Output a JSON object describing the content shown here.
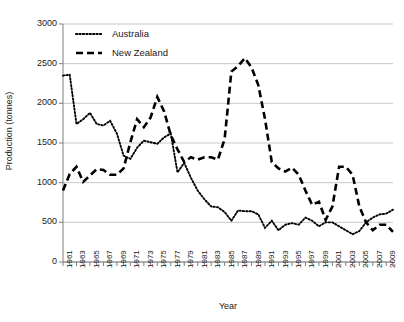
{
  "chart_data": {
    "type": "line",
    "title": "",
    "xlabel": "Year",
    "ylabel": "Production (tonnes)",
    "xlim": [
      1961,
      2010
    ],
    "ylim": [
      0,
      3000
    ],
    "yticks": [
      0,
      500,
      1000,
      1500,
      2000,
      2500,
      3000
    ],
    "ytick_labels": [
      "0",
      "500",
      "1000",
      "1500",
      "2000",
      "2500",
      "3000"
    ],
    "xticks": [
      1961,
      1962,
      1963,
      1964,
      1965,
      1966,
      1967,
      1968,
      1969,
      1970,
      1971,
      1972,
      1973,
      1974,
      1975,
      1976,
      1977,
      1978,
      1979,
      1980,
      1981,
      1982,
      1983,
      1984,
      1985,
      1986,
      1987,
      1988,
      1989,
      1990,
      1991,
      1992,
      1993,
      1994,
      1995,
      1996,
      1997,
      1998,
      1999,
      2000,
      2001,
      2002,
      2003,
      2004,
      2005,
      2006,
      2007,
      2008,
      2009,
      2010
    ],
    "xtick_labels": [
      "1961",
      "",
      "1963",
      "",
      "1965",
      "",
      "1967",
      "",
      "1969",
      "",
      "1971",
      "",
      "1973",
      "",
      "1975",
      "",
      "1977",
      "",
      "1979",
      "",
      "1981",
      "",
      "1983",
      "",
      "1985",
      "",
      "1987",
      "",
      "1989",
      "",
      "1991",
      "",
      "1993",
      "",
      "1995",
      "",
      "1997",
      "",
      "1999",
      "",
      "2001",
      "",
      "2003",
      "",
      "2005",
      "",
      "2007",
      "",
      "2009",
      ""
    ],
    "grid": "horizontal",
    "legend_position": "top-left-inside",
    "x": [
      1961,
      1962,
      1963,
      1964,
      1965,
      1966,
      1967,
      1968,
      1969,
      1970,
      1971,
      1972,
      1973,
      1974,
      1975,
      1976,
      1977,
      1978,
      1979,
      1980,
      1981,
      1982,
      1983,
      1984,
      1985,
      1986,
      1987,
      1988,
      1989,
      1990,
      1991,
      1992,
      1993,
      1994,
      1995,
      1996,
      1997,
      1998,
      1999,
      2000,
      2001,
      2002,
      2003,
      2004,
      2005,
      2006,
      2007,
      2008,
      2009,
      2010
    ],
    "series": [
      {
        "name": "Australia",
        "style": "dotted",
        "color": "#000000",
        "values": [
          2350,
          2360,
          1740,
          1800,
          1880,
          1740,
          1720,
          1780,
          1620,
          1340,
          1300,
          1440,
          1530,
          1510,
          1490,
          1570,
          1620,
          1130,
          1250,
          1060,
          900,
          790,
          700,
          690,
          630,
          520,
          650,
          640,
          640,
          600,
          430,
          520,
          400,
          470,
          490,
          470,
          560,
          520,
          450,
          500,
          500,
          450,
          400,
          350,
          390,
          500,
          560,
          600,
          610,
          660
        ]
      },
      {
        "name": "New Zealand",
        "style": "dashed",
        "color": "#000000",
        "values": [
          900,
          1110,
          1200,
          1010,
          1090,
          1170,
          1160,
          1100,
          1100,
          1180,
          1510,
          1800,
          1700,
          1820,
          2080,
          1900,
          1600,
          1420,
          1260,
          1320,
          1290,
          1320,
          1320,
          1290,
          1550,
          2400,
          2470,
          2570,
          2450,
          2230,
          1800,
          1260,
          1180,
          1140,
          1190,
          1100,
          900,
          720,
          760,
          530,
          700,
          1200,
          1200,
          1100,
          700,
          500,
          400,
          470,
          470,
          380
        ]
      }
    ],
    "series2_tail": {
      "note": "Australia later segment rises to ~720 then ~800 then ~870 at end; New Zealand falls to ~150 at end"
    }
  },
  "legend": {
    "items": [
      {
        "label": "Australia",
        "style": "dotted"
      },
      {
        "label": "New Zealand",
        "style": "dashed"
      }
    ]
  },
  "axes": {
    "ylabel": "Production (tonnes)",
    "xlabel": "Year"
  },
  "colors": {
    "line": "#000000",
    "grid": "#c8c8c8",
    "axis": "#7f7f7f",
    "text": "#1a1a1a",
    "background": "#ffffff"
  }
}
